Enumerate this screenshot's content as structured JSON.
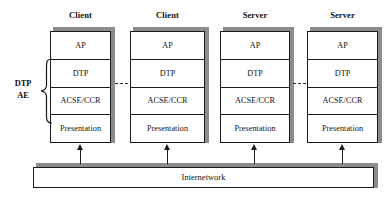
{
  "diagram": {
    "columns": [
      {
        "header": "Client",
        "x": 50,
        "width": 61
      },
      {
        "header": "Client",
        "x": 130,
        "width": 75
      },
      {
        "header": "Server",
        "x": 220,
        "width": 70
      },
      {
        "header": "Server",
        "x": 307,
        "width": 71
      }
    ],
    "layers": [
      "AP",
      "DTP",
      "ACSE/CCR",
      "Presentation"
    ],
    "group_label": {
      "line1": "DTP",
      "line2": "AE",
      "spans": [
        "DTP",
        "ACSE/CCR"
      ]
    },
    "network": {
      "label": "Internetwork",
      "x": 33,
      "width": 341
    },
    "continuations": [
      {
        "after_column": 1,
        "marks": "..."
      },
      {
        "after_column": 3,
        "marks": "..."
      }
    ],
    "arrows": {
      "count": 4,
      "direction": "up",
      "from": "Internetwork",
      "to": "Presentation"
    },
    "colors": {
      "line": "#1a1a1a",
      "shadow": "#8c8c8c",
      "fill": "#ffffff",
      "text": "#111111",
      "background": "#ffffff"
    }
  }
}
